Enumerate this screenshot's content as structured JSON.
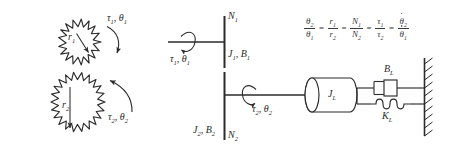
{
  "diagram": {
    "background_color": "#ffffff",
    "line_color": "#2b2b2b",
    "text_color": "#3a3a3a"
  },
  "gears_panel": {
    "gear_small": {
      "name": "gear-1",
      "radius_label": "r",
      "radius_sub": "1",
      "teeth": 16
    },
    "gear_large": {
      "name": "gear-2",
      "radius_label": "r",
      "radius_sub": "2",
      "teeth": 28
    },
    "torque_1": {
      "tau": "τ",
      "tau_sub": "1",
      "theta": "θ",
      "theta_sub": "1",
      "text": "τ₁, θ₁"
    },
    "torque_2": {
      "tau": "τ",
      "tau_sub": "2",
      "theta": "θ",
      "theta_sub": "2",
      "text": "τ₂, θ₂"
    }
  },
  "shaft_panel": {
    "input_shaft": {
      "torque_label": "τ",
      "torque_sub": "1",
      "theta_label": "θ",
      "theta_sub": "1"
    },
    "output_shaft": {
      "torque_label": "τ",
      "torque_sub": "2",
      "theta_label": "θ",
      "theta_sub": "2"
    },
    "gear_1_teeth_label": "N",
    "gear_1_teeth_sub": "1",
    "gear_2_teeth_label": "N",
    "gear_2_teeth_sub": "2",
    "inertia_1_label": "J",
    "inertia_1_sub": "1",
    "damping_1_label": "B",
    "damping_1_sub": "1",
    "inertia_2_label": "J",
    "inertia_2_sub": "2",
    "damping_2_label": "B",
    "damping_2_sub": "2"
  },
  "load_panel": {
    "inertia_label": "J",
    "inertia_sub": "L",
    "damper_label": "B",
    "damper_sub": "L",
    "spring_label": "K",
    "spring_sub": "L",
    "wall": "fixed-ground"
  },
  "equation": {
    "terms": [
      {
        "num": "θ",
        "num_sub": "2",
        "den": "θ",
        "den_sub": "1",
        "num_dot": false,
        "den_dot": false
      },
      {
        "num": "r",
        "num_sub": "1",
        "den": "r",
        "den_sub": "2",
        "num_dot": false,
        "den_dot": false
      },
      {
        "num": "N",
        "num_sub": "1",
        "den": "N",
        "den_sub": "2",
        "num_dot": false,
        "den_dot": false
      },
      {
        "num": "τ",
        "num_sub": "1",
        "den": "τ",
        "den_sub": "2",
        "num_dot": false,
        "den_dot": false
      },
      {
        "num": "θ",
        "num_sub": "2",
        "den": "θ",
        "den_sub": "1",
        "num_dot": true,
        "den_dot": true
      }
    ],
    "operator": "=",
    "plain_text": "θ₂/θ₁ = r₁/r₂ = N₁/N₂ = τ₁/τ₂ = θ̇₂/θ̇₁"
  }
}
